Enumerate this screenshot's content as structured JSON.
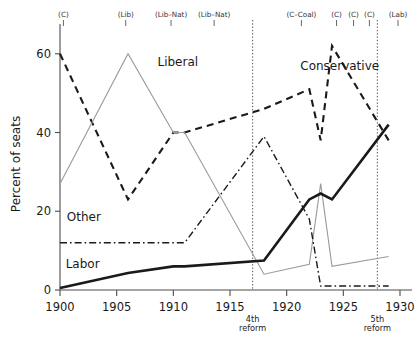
{
  "chart_data": {
    "type": "line",
    "title": "",
    "xlabel": "",
    "ylabel": "Percent of seats",
    "xlim": [
      1900,
      1930
    ],
    "ylim": [
      0,
      64
    ],
    "grid": false,
    "legend": "inline-labels",
    "xticks": [
      "1900",
      "1905",
      "1910",
      "1915",
      "1920",
      "1925",
      "1930"
    ],
    "xtick_values": [
      1900,
      1905,
      1910,
      1915,
      1920,
      1925,
      1930
    ],
    "yticks": [
      "0",
      "20",
      "40",
      "60"
    ],
    "ytick_values": [
      0,
      20,
      40,
      60
    ],
    "series": [
      {
        "name": "Conservative",
        "style": "dashed",
        "color": "#1a1a1a",
        "width": 2.1,
        "label_text": "Conservative",
        "label_x": 1921.2,
        "label_y": 56,
        "x": [
          1900,
          1906,
          1910,
          1911,
          1918,
          1922,
          1923,
          1924,
          1929
        ],
        "y": [
          60,
          23,
          40,
          40,
          46,
          51,
          38,
          62,
          38
        ]
      },
      {
        "name": "Liberal",
        "style": "solid-thin",
        "color": "#9a9a9a",
        "width": 1.1,
        "label_text": "Liberal",
        "label_x": 1908.6,
        "label_y": 57,
        "x": [
          1900,
          1906,
          1910,
          1911,
          1918,
          1922,
          1923,
          1924,
          1929
        ],
        "y": [
          27,
          60,
          40,
          40,
          4,
          6.5,
          27,
          6,
          8.5
        ]
      },
      {
        "name": "Other",
        "style": "dashdot",
        "color": "#1a1a1a",
        "width": 1.4,
        "label_text": "Other",
        "label_x": 1900.6,
        "label_y": 17.5,
        "x": [
          1900,
          1906,
          1910,
          1911,
          1918,
          1922,
          1923,
          1924,
          1929
        ],
        "y": [
          12,
          12,
          12,
          12,
          39,
          18,
          1,
          1,
          1
        ]
      },
      {
        "name": "Labor",
        "style": "solid-thick",
        "color": "#1a1a1a",
        "width": 2.6,
        "label_text": "Labor",
        "label_x": 1900.5,
        "label_y": 5.5,
        "x": [
          1900,
          1906,
          1910,
          1911,
          1918,
          1922,
          1923,
          1924,
          1929
        ],
        "y": [
          0.5,
          4.3,
          6,
          6,
          7.5,
          23,
          24.5,
          23,
          42
        ]
      }
    ],
    "era_markers": [
      {
        "label": "(C)",
        "x": 1900.3
      },
      {
        "label": "(Lib)",
        "x": 1905.8
      },
      {
        "label": "(Lib–Nat)",
        "x": 1909.8
      },
      {
        "label": "(Lib–Nat)",
        "x": 1913.6
      },
      {
        "label": "(C–Coal)",
        "x": 1921.3
      },
      {
        "label": "(C)",
        "x": 1924.4
      },
      {
        "label": "(C)",
        "x": 1925.9
      },
      {
        "label": "(C)",
        "x": 1927.3
      },
      {
        "label": "(Lab)",
        "x": 1932.0
      }
    ],
    "reform_lines": [
      {
        "label_line1": "4th",
        "label_line2": "reform",
        "x": 1917.0
      },
      {
        "label_line1": "5th",
        "label_line2": "reform",
        "x": 1928.0
      }
    ]
  }
}
